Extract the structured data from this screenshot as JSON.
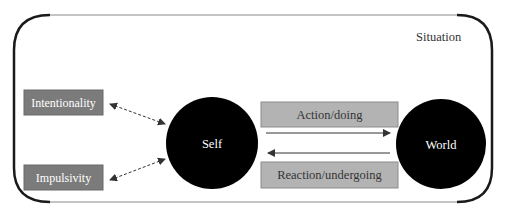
{
  "diagram": {
    "frame": {
      "label": "Situation"
    },
    "nodes": {
      "self": {
        "label": "Self"
      },
      "world": {
        "label": "World"
      },
      "intentionality": {
        "label": "Intentionality"
      },
      "impulsivity": {
        "label": "Impulsivity"
      },
      "action": {
        "label": "Action/doing"
      },
      "reaction": {
        "label": "Reaction/undergoing"
      }
    },
    "colors": {
      "circle_fill": "#000000",
      "circle_text": "#ffffff",
      "trait_box_fill": "#7b7b7b",
      "trait_box_border": "#6a6a6a",
      "trait_text": "#ffffff",
      "process_box_fill": "#b3b3b3",
      "process_box_border": "#8c8c8c",
      "process_text": "#333333",
      "frame_curve": "#1a1a1a",
      "frame_line": "#8a8a8a",
      "arrow": "#333333"
    }
  }
}
